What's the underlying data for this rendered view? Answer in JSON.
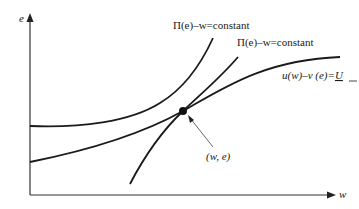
{
  "diagram": {
    "axes": {
      "y_label": "e",
      "x_label": "w"
    },
    "curves": [
      {
        "id": "isoprofit-upper",
        "label": "Π(e)–w=constant"
      },
      {
        "id": "isoprofit-lower",
        "label": "Π(e)–w=constant"
      },
      {
        "id": "participation",
        "label_main": "u(w)–v (e)=",
        "label_u": "U"
      }
    ],
    "point": {
      "label": "(w, e)"
    },
    "colors": {
      "line": "#1a1a1a",
      "axis": "#333333",
      "background": "#ffffff"
    }
  }
}
